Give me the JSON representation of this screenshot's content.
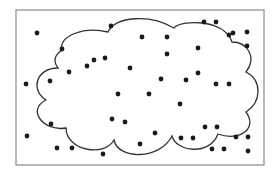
{
  "diagram": {
    "type": "cloud-with-scattered-points",
    "frame": {
      "x": 16,
      "y": 10,
      "width": 248,
      "height": 155,
      "stroke": "#8a8a8a"
    },
    "cloud": {
      "stroke": "#333333",
      "fill": "#ffffff"
    },
    "dot_color": "#1a1a1a",
    "dot_radius": 2.4,
    "points": [
      [
        37,
        33
      ],
      [
        111,
        26
      ],
      [
        204,
        22
      ],
      [
        216,
        22
      ],
      [
        142,
        37
      ],
      [
        167,
        37
      ],
      [
        229,
        35
      ],
      [
        233,
        33
      ],
      [
        247,
        32
      ],
      [
        247,
        46
      ],
      [
        62,
        49
      ],
      [
        198,
        48
      ],
      [
        105,
        58
      ],
      [
        94,
        60
      ],
      [
        87,
        66
      ],
      [
        69,
        72
      ],
      [
        130,
        68
      ],
      [
        167,
        54
      ],
      [
        198,
        73
      ],
      [
        50,
        81
      ],
      [
        26,
        84
      ],
      [
        161,
        79
      ],
      [
        186,
        80
      ],
      [
        216,
        84
      ],
      [
        229,
        84
      ],
      [
        118,
        94
      ],
      [
        149,
        94
      ],
      [
        180,
        104
      ],
      [
        51,
        124
      ],
      [
        112,
        119
      ],
      [
        125,
        122
      ],
      [
        205,
        127
      ],
      [
        217,
        127
      ],
      [
        155,
        133
      ],
      [
        27,
        136
      ],
      [
        181,
        138
      ],
      [
        193,
        138
      ],
      [
        236,
        137
      ],
      [
        248,
        137
      ],
      [
        140,
        144
      ],
      [
        57,
        148
      ],
      [
        72,
        148
      ],
      [
        212,
        149
      ],
      [
        224,
        149
      ],
      [
        248,
        151
      ],
      [
        103,
        154
      ]
    ]
  }
}
